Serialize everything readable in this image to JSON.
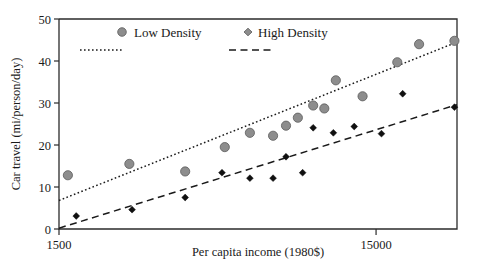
{
  "chart_data": {
    "type": "scatter",
    "title": "",
    "xlabel": "Per capita income (1980$)",
    "ylabel": "Car travel (mi/person/day)",
    "xscale": "log",
    "xlim": [
      1500,
      27000
    ],
    "ylim": [
      0,
      50
    ],
    "xticks": [
      1500,
      15000
    ],
    "xticklabels": [
      "1500",
      "15000"
    ],
    "yticks": [
      0,
      10,
      20,
      30,
      40,
      50
    ],
    "yticklabels": [
      "0",
      "10",
      "20",
      "30",
      "40",
      "50"
    ],
    "grid": false,
    "legend_position": "top-inside",
    "series": [
      {
        "name": "Low Density",
        "marker": "circle",
        "color": "#8d8d8d",
        "points": [
          {
            "x": 1600,
            "y": 12.8
          },
          {
            "x": 2500,
            "y": 15.5
          },
          {
            "x": 3750,
            "y": 13.7
          },
          {
            "x": 5000,
            "y": 19.5
          },
          {
            "x": 6000,
            "y": 22.9
          },
          {
            "x": 7100,
            "y": 22.2
          },
          {
            "x": 7800,
            "y": 24.6
          },
          {
            "x": 8500,
            "y": 26.5
          },
          {
            "x": 9500,
            "y": 29.4
          },
          {
            "x": 10300,
            "y": 28.7
          },
          {
            "x": 11200,
            "y": 35.4
          },
          {
            "x": 13600,
            "y": 31.6
          },
          {
            "x": 17500,
            "y": 39.7
          },
          {
            "x": 20500,
            "y": 44.0
          },
          {
            "x": 26500,
            "y": 44.8
          }
        ],
        "fit_line": {
          "style": "dotted",
          "x1": 1500,
          "y1": 6.8,
          "x2": 27000,
          "y2": 44.5
        }
      },
      {
        "name": "High Density",
        "marker": "diamond",
        "color": "#101010",
        "points": [
          {
            "x": 1700,
            "y": 3.1
          },
          {
            "x": 2550,
            "y": 4.6
          },
          {
            "x": 3750,
            "y": 7.5
          },
          {
            "x": 4900,
            "y": 13.4
          },
          {
            "x": 6000,
            "y": 12.1
          },
          {
            "x": 7100,
            "y": 12.1
          },
          {
            "x": 7800,
            "y": 17.2
          },
          {
            "x": 8800,
            "y": 13.4
          },
          {
            "x": 9500,
            "y": 24.1
          },
          {
            "x": 11000,
            "y": 22.9
          },
          {
            "x": 12800,
            "y": 24.4
          },
          {
            "x": 15600,
            "y": 22.7
          },
          {
            "x": 18200,
            "y": 32.2
          },
          {
            "x": 26500,
            "y": 29.0
          }
        ],
        "fit_line": {
          "style": "dashed",
          "x1": 1500,
          "y1": 0.2,
          "x2": 27000,
          "y2": 29.6
        }
      }
    ],
    "legend": [
      {
        "label": "Low Density",
        "marker": "circle",
        "line_style": "dotted"
      },
      {
        "label": "High Density",
        "marker": "diamond",
        "line_style": "dashed"
      }
    ]
  }
}
